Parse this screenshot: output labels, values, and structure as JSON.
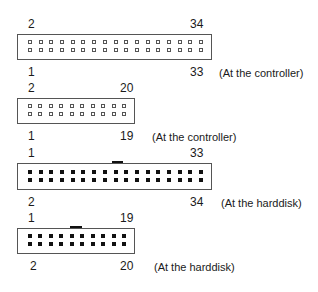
{
  "diagram": {
    "connectors": [
      {
        "id": "controller-34",
        "caption": "(At the controller)",
        "pin_style": "hollow",
        "pins": 34,
        "columns": 17,
        "top_left_label": "2",
        "top_right_label": "34",
        "bottom_left_label": "1",
        "bottom_right_label": "33",
        "key_notch": false
      },
      {
        "id": "controller-20",
        "caption": "(At the controller)",
        "pin_style": "hollow",
        "pins": 20,
        "columns": 10,
        "top_left_label": "2",
        "top_right_label": "20",
        "bottom_left_label": "1",
        "bottom_right_label": "19",
        "key_notch": false
      },
      {
        "id": "harddisk-34",
        "caption": "(At the harddisk)",
        "pin_style": "solid",
        "pins": 34,
        "columns": 17,
        "top_left_label": "1",
        "top_right_label": "33",
        "bottom_left_label": "2",
        "bottom_right_label": "34",
        "key_notch": true
      },
      {
        "id": "harddisk-20",
        "caption": "(At the harddisk)",
        "pin_style": "solid",
        "pins": 20,
        "columns": 10,
        "top_left_label": "1",
        "top_right_label": "19",
        "bottom_left_label": "2",
        "bottom_right_label": "20",
        "key_notch": true
      }
    ]
  }
}
